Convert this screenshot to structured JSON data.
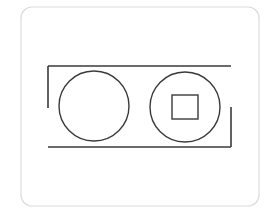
{
  "diagram": {
    "colors": {
      "background": "#ffffff",
      "frame_stroke": "#dcdcdc",
      "line_stroke": "#3a3a3a"
    },
    "frame": {
      "x": 21,
      "y": 7,
      "width": 238,
      "height": 199,
      "radius": 11
    },
    "bracket": {
      "top_line": {
        "x1": 48,
        "y1": 66,
        "x2": 231,
        "y2": 66
      },
      "left_vertical": {
        "x1": 48,
        "y1": 66,
        "x2": 48,
        "y2": 108
      },
      "bottom_line": {
        "x1": 48,
        "y1": 147,
        "x2": 231,
        "y2": 147
      },
      "right_vertical": {
        "x1": 231,
        "y1": 107,
        "x2": 231,
        "y2": 147
      }
    },
    "circles": [
      {
        "name": "left-circle",
        "cx": 94,
        "cy": 106,
        "r": 35
      },
      {
        "name": "right-circle",
        "cx": 185,
        "cy": 107,
        "r": 35
      }
    ],
    "square": {
      "x": 172,
      "y": 95,
      "width": 26,
      "height": 24
    }
  }
}
